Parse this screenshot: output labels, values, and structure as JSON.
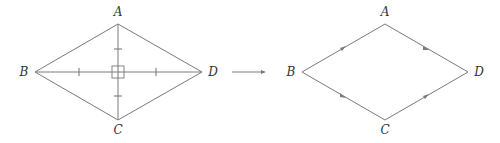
{
  "figure": {
    "left": {
      "title": "rhombus-with-diagonals",
      "vertices": [
        {
          "label": "A",
          "x": 118,
          "y": 24,
          "lx": 118,
          "ly": 16
        },
        {
          "label": "B",
          "x": 35,
          "y": 72,
          "lx": 24,
          "ly": 76
        },
        {
          "label": "C",
          "x": 118,
          "y": 120,
          "lx": 118,
          "ly": 134
        },
        {
          "label": "D",
          "x": 202,
          "y": 72,
          "lx": 213,
          "ly": 76
        }
      ]
    },
    "transform_arrow": {
      "x1": 232,
      "y1": 72,
      "x2": 265,
      "y2": 72
    },
    "right": {
      "title": "rhombus-with-parallel-arrows",
      "vertices": [
        {
          "label": "A",
          "x": 385,
          "y": 24,
          "lx": 385,
          "ly": 16
        },
        {
          "label": "B",
          "x": 302,
          "y": 72,
          "lx": 291,
          "ly": 76
        },
        {
          "label": "C",
          "x": 385,
          "y": 120,
          "lx": 385,
          "ly": 134
        },
        {
          "label": "D",
          "x": 468,
          "y": 72,
          "lx": 479,
          "ly": 76
        }
      ]
    },
    "colors": {
      "line": "#7a7a7a",
      "text": "#333333"
    }
  }
}
